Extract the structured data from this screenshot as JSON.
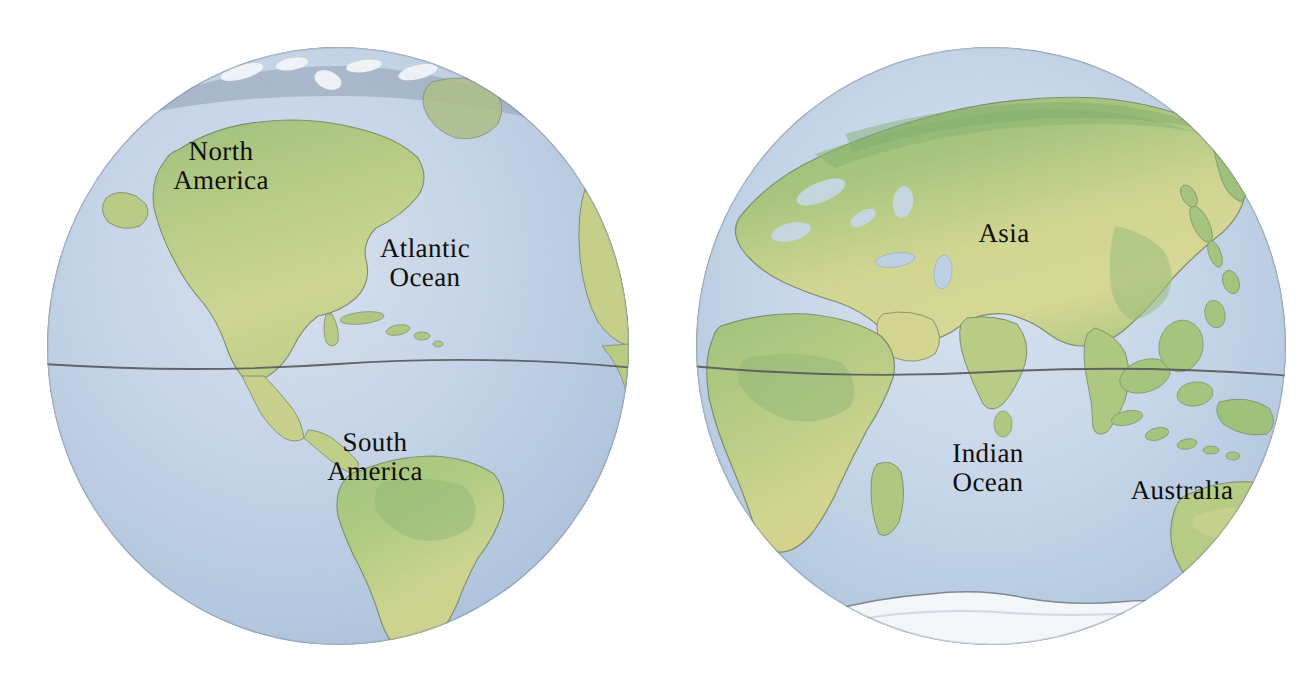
{
  "illustration": {
    "title": "World Hemispheres",
    "style": "watercolor-colored-pencil",
    "background_color": "#ffffff",
    "globe_count": 2
  },
  "palette": {
    "ocean_light": "#c3d3e6",
    "ocean_mid": "#a9c0dc",
    "ocean_deep": "#8fabcf",
    "land_green": "#8fb862",
    "land_yellow_green": "#c2cc74",
    "land_olive": "#b9c266",
    "land_deep_green": "#74a357",
    "ice_white": "#f2f5f8",
    "arctic_gray": "#8c9cb0",
    "outline": "#3a3f45",
    "label_text": "#100c08",
    "equator_line": "#2b2f34"
  },
  "globes": [
    {
      "id": "globe-west",
      "name": "Western Hemisphere",
      "center_x": 338,
      "center_y": 346,
      "radius_x": 292,
      "radius_y": 300,
      "equator_y": 364,
      "features": [
        "North America",
        "South America",
        "Greenland",
        "Caribbean islands",
        "Western Africa edge",
        "Arctic ice cap"
      ],
      "labels": [
        {
          "id": "label-north-america",
          "text": "North\nAmerica",
          "kind": "continent",
          "x": 221,
          "y": 166
        },
        {
          "id": "label-atlantic-ocean",
          "text": "Atlantic\nOcean",
          "kind": "ocean",
          "x": 425,
          "y": 263
        },
        {
          "id": "label-south-america",
          "text": "South\nAmerica",
          "kind": "continent",
          "x": 375,
          "y": 457
        }
      ]
    },
    {
      "id": "globe-east",
      "name": "Eastern Hemisphere",
      "center_x": 991,
      "center_y": 346,
      "radius_x": 296,
      "radius_y": 300,
      "equator_y": 370,
      "features": [
        "Asia",
        "Europe",
        "Africa",
        "Madagascar",
        "Indian subcontinent",
        "Southeast Asian archipelago",
        "Australia",
        "Antarctic ice cap"
      ],
      "labels": [
        {
          "id": "label-asia",
          "text": "Asia",
          "kind": "continent",
          "x": 1004,
          "y": 233
        },
        {
          "id": "label-indian-ocean",
          "text": "Indian\nOcean",
          "kind": "ocean",
          "x": 988,
          "y": 468
        },
        {
          "id": "label-australia",
          "text": "Australia",
          "kind": "continent",
          "x": 1182,
          "y": 490
        }
      ]
    }
  ],
  "annotations": {
    "equator_label": "Equator line (unlabeled horizontal line across both globes)"
  }
}
